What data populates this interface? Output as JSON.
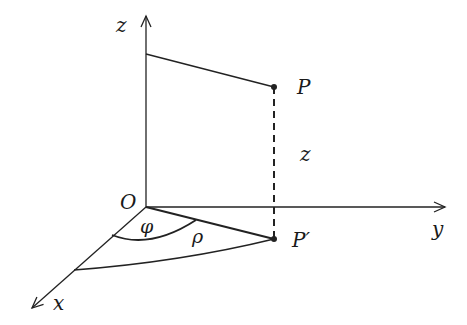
{
  "diagram": {
    "labels": {
      "z_axis": "z",
      "y_axis": "y",
      "x_axis": "x",
      "origin": "O",
      "point": "P",
      "projection": "P′",
      "height": "z",
      "angle": "φ",
      "radius": "ρ"
    },
    "colors": {
      "stroke": "#222222",
      "background": "#ffffff"
    }
  }
}
